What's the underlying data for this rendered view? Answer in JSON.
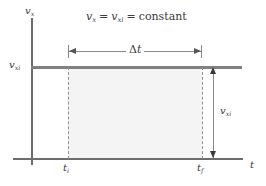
{
  "chart_data": {
    "type": "line",
    "equation": {
      "lhs": "v",
      "lhs_sub": "x",
      "mid": "v",
      "mid_sub": "xi",
      "rhs": "constant"
    },
    "xlabel": "t",
    "ylabel": "v",
    "ylabel_sub": "x",
    "series": [
      {
        "name": "v_xi",
        "type": "horizontal-line",
        "value_label": "v_xi",
        "x_start": "t_i",
        "x_end": "t_f"
      }
    ],
    "x_ticks": [
      {
        "label": "t",
        "sub": "i"
      },
      {
        "label": "t",
        "sub": "f"
      }
    ],
    "y_ticks": [
      {
        "label": "v",
        "sub": "xi"
      }
    ],
    "annotations": [
      {
        "name": "delta-t",
        "label": "Δt",
        "symbol": "Δ",
        "var": "t",
        "orientation": "horizontal",
        "from": "t_i",
        "to": "t_f"
      },
      {
        "name": "v-xi-magnitude",
        "label": "v_xi",
        "var": "v",
        "sub": "xi",
        "orientation": "vertical",
        "from": "0",
        "to": "v_xi"
      }
    ],
    "shaded_region": {
      "name": "displacement-area",
      "color": "#f4f4f4",
      "from_x": "t_i",
      "to_x": "t_f",
      "from_y": "0",
      "to_y": "v_xi"
    },
    "grid": false,
    "legend": null
  },
  "labels": {
    "y_axis_var": "v",
    "y_axis_sub": "x",
    "y_value_var": "v",
    "y_value_sub": "xi",
    "x_axis_var": "t",
    "tick_ti_var": "t",
    "tick_ti_sub": "i",
    "tick_tf_var": "t",
    "tick_tf_sub": "f",
    "delta_symbol": "Δ",
    "delta_var": "t",
    "measure_var": "v",
    "measure_sub": "xi",
    "eq_lhs_var": "v",
    "eq_lhs_sub": "x",
    "eq_sign_one": "=",
    "eq_mid_var": "v",
    "eq_mid_sub": "xi",
    "eq_sign_two": "=",
    "eq_rhs": "constant"
  },
  "colors": {
    "axis": "#6d6d6d",
    "velocity_line": "#808080",
    "dashed": "#909090",
    "area_fill": "#f4f4f4",
    "text": "#3a3a3a",
    "arrow": "#555555",
    "background": "#ffffff"
  }
}
